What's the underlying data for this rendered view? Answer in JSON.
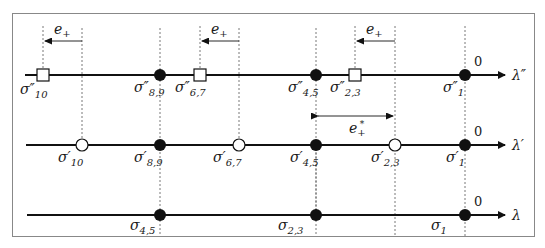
{
  "figure": {
    "axes": [
      {
        "id": "lambda_double_prime",
        "axis_label": "λ″",
        "origin_label": "0",
        "points": [
          {
            "label_base": "σ",
            "sup": "″",
            "sub": "10",
            "marker": "square-open"
          },
          {
            "label_base": "σ",
            "sup": "″",
            "sub": "8,9",
            "marker": "circle-filled"
          },
          {
            "label_base": "σ",
            "sup": "″",
            "sub": "6,7",
            "marker": "square-open"
          },
          {
            "label_base": "σ",
            "sup": "″",
            "sub": "4,5",
            "marker": "circle-filled"
          },
          {
            "label_base": "σ",
            "sup": "″",
            "sub": "2,3",
            "marker": "square-open"
          },
          {
            "label_base": "σ",
            "sup": "″",
            "sub": "1",
            "marker": "circle-filled"
          }
        ],
        "shift_arrows": [
          {
            "label": "e₊",
            "direction": "left"
          },
          {
            "label": "e₊",
            "direction": "left"
          },
          {
            "label": "e₊",
            "direction": "left"
          }
        ]
      },
      {
        "id": "lambda_prime",
        "axis_label": "λ′",
        "origin_label": "0",
        "points": [
          {
            "label_base": "σ",
            "sup": "′",
            "sub": "10",
            "marker": "circle-open"
          },
          {
            "label_base": "σ",
            "sup": "′",
            "sub": "8,9",
            "marker": "circle-filled"
          },
          {
            "label_base": "σ",
            "sup": "′",
            "sub": "6,7",
            "marker": "circle-open"
          },
          {
            "label_base": "σ",
            "sup": "′",
            "sub": "4,5",
            "marker": "circle-filled"
          },
          {
            "label_base": "σ",
            "sup": "′",
            "sub": "2,3",
            "marker": "circle-open"
          },
          {
            "label_base": "σ",
            "sup": "′",
            "sub": "1",
            "marker": "circle-filled"
          }
        ],
        "interval": {
          "label": "e₊*",
          "direction": "both"
        }
      },
      {
        "id": "lambda",
        "axis_label": "λ",
        "origin_label": "0",
        "points": [
          {
            "label_base": "σ",
            "sup": "",
            "sub": "4,5",
            "marker": "circle-filled"
          },
          {
            "label_base": "σ",
            "sup": "",
            "sub": "2,3",
            "marker": "circle-filled"
          },
          {
            "label_base": "σ",
            "sup": "",
            "sub": "1",
            "marker": "circle-filled"
          }
        ]
      }
    ],
    "labels": {
      "top": {
        "s10": "σ″",
        "s10_sub": "10",
        "s89": "σ″",
        "s89_sub": "8,9",
        "s67": "σ″",
        "s67_sub": "6,7",
        "s45": "σ″",
        "s45_sub": "4,5",
        "s23": "σ″",
        "s23_sub": "2,3",
        "s1": "σ″",
        "s1_sub": "1",
        "axis": "λ″",
        "zero": "0",
        "e1": "e",
        "e2": "e",
        "e3": "e",
        "e_sub": "+"
      },
      "mid": {
        "s10": "σ′",
        "s10_sub": "10",
        "s89": "σ′",
        "s89_sub": "8,9",
        "s67": "σ′",
        "s67_sub": "6,7",
        "s45": "σ′",
        "s45_sub": "4,5",
        "s23": "σ′",
        "s23_sub": "2,3",
        "s1": "σ′",
        "s1_sub": "1",
        "axis": "λ′",
        "zero": "0",
        "estar": "e",
        "estar_sub": "+",
        "estar_sup": "*"
      },
      "bot": {
        "s45": "σ",
        "s45_sub": "4,5",
        "s23": "σ",
        "s23_sub": "2,3",
        "s1": "σ",
        "s1_sub": "1",
        "axis": "λ",
        "zero": "0"
      }
    },
    "colors": {
      "line": "#111111",
      "dashed": "#555555",
      "border": "#888888",
      "fill": "#111111",
      "open_fill": "#ffffff"
    }
  }
}
